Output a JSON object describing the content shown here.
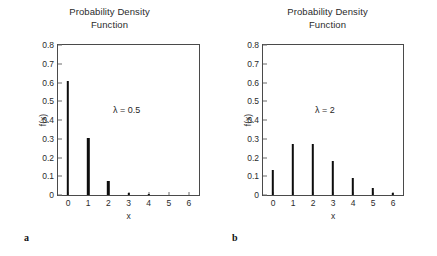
{
  "figure": {
    "panels": [
      {
        "letter": "a",
        "title": "Probability Density\nFunction",
        "annotation": "λ = 0.5",
        "xlabel": "x",
        "ylabel": "f(x)",
        "chart_data": {
          "type": "bar",
          "title": "Probability Density Function",
          "subtitle": "",
          "xlabel": "x",
          "ylabel": "f(x)",
          "xlim": [
            -0.5,
            6.5
          ],
          "ylim": [
            0,
            0.8
          ],
          "xticks": [
            "0",
            "1",
            "2",
            "3",
            "4",
            "5",
            "6"
          ],
          "yticks": [
            "0",
            "0.1",
            "0.2",
            "0.3",
            "0.4",
            "0.5",
            "0.6",
            "0.7",
            "0.8"
          ],
          "grid": false,
          "legend": "none",
          "annotations": [
            "λ = 0.5"
          ],
          "categories": [
            0,
            1,
            2,
            3,
            4,
            5,
            6
          ],
          "values": [
            0.607,
            0.303,
            0.076,
            0.013,
            0.002,
            0.0,
            0.0
          ]
        }
      },
      {
        "letter": "b",
        "title": "Probability Density\nFunction",
        "annotation": "λ = 2",
        "xlabel": "x",
        "ylabel": "f(x)",
        "chart_data": {
          "type": "bar",
          "title": "Probability Density Function",
          "subtitle": "",
          "xlabel": "x",
          "ylabel": "f(x)",
          "xlim": [
            -0.5,
            6.5
          ],
          "ylim": [
            0,
            0.8
          ],
          "xticks": [
            "0",
            "1",
            "2",
            "3",
            "4",
            "5",
            "6"
          ],
          "yticks": [
            "0",
            "0.1",
            "0.2",
            "0.3",
            "0.4",
            "0.5",
            "0.6",
            "0.7",
            "0.8"
          ],
          "grid": false,
          "legend": "none",
          "annotations": [
            "λ = 2"
          ],
          "categories": [
            0,
            1,
            2,
            3,
            4,
            5,
            6
          ],
          "values": [
            0.135,
            0.271,
            0.271,
            0.18,
            0.09,
            0.036,
            0.012
          ]
        }
      }
    ]
  },
  "chart_data": [
    {
      "type": "bar",
      "title": "Probability Density Function",
      "xlabel": "x",
      "ylabel": "f(x)",
      "xlim": [
        -0.5,
        6.5
      ],
      "ylim": [
        0,
        0.8
      ],
      "grid": false,
      "legend": "none",
      "annotations": [
        "λ = 0.5"
      ],
      "panel": "a",
      "categories": [
        0,
        1,
        2,
        3,
        4,
        5,
        6
      ],
      "values": [
        0.607,
        0.303,
        0.076,
        0.013,
        0.002,
        0.0,
        0.0
      ]
    },
    {
      "type": "bar",
      "title": "Probability Density Function",
      "xlabel": "x",
      "ylabel": "f(x)",
      "xlim": [
        -0.5,
        6.5
      ],
      "ylim": [
        0,
        0.8
      ],
      "grid": false,
      "legend": "none",
      "annotations": [
        "λ = 2"
      ],
      "panel": "b",
      "categories": [
        0,
        1,
        2,
        3,
        4,
        5,
        6
      ],
      "values": [
        0.135,
        0.271,
        0.271,
        0.18,
        0.09,
        0.036,
        0.012
      ]
    }
  ]
}
